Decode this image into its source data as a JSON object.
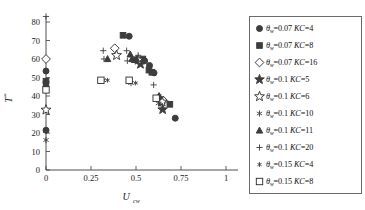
{
  "chart_data": {
    "type": "scatter",
    "title": "",
    "xlabel": "U_cw",
    "xlabel_main": "U",
    "xlabel_sub": "cw",
    "ylabel": "T*",
    "ylabel_main": "T",
    "ylabel_star": "*",
    "xlim": [
      0,
      1
    ],
    "ylim": [
      0,
      80
    ],
    "xticks": [
      0,
      0.25,
      0.5,
      0.75,
      1
    ],
    "xticklabels": [
      "0",
      "0.25",
      "0.5",
      "0.75",
      "1"
    ],
    "yticks": [
      0,
      10,
      20,
      30,
      40,
      50,
      60,
      70,
      80
    ],
    "yticklabels": [
      "0",
      "10",
      "20",
      "30",
      "40",
      "50",
      "60",
      "70",
      "80"
    ],
    "grid": false,
    "legend_position": "right-outside",
    "series": [
      {
        "name": "theta_w=0.07 KC=4",
        "label_theta": "θ",
        "label_sub": "w",
        "label_rest": "=0.07 ",
        "label_kc": "KC",
        "label_val": "=4",
        "marker": "filled-circle",
        "points": [
          {
            "x": 0.0,
            "y": 21.5
          },
          {
            "x": 0.0,
            "y": 47.5
          },
          {
            "x": 0.0,
            "y": 53.5
          },
          {
            "x": 0.462,
            "y": 72.3
          },
          {
            "x": 0.548,
            "y": 59.0
          },
          {
            "x": 0.575,
            "y": 56.5
          },
          {
            "x": 0.6,
            "y": 52.5
          },
          {
            "x": 0.718,
            "y": 28.0
          }
        ]
      },
      {
        "name": "theta_w=0.07 KC=8",
        "label_theta": "θ",
        "label_sub": "w",
        "label_rest": "=0.07 ",
        "label_kc": "KC",
        "label_val": "=8",
        "marker": "filled-square",
        "points": [
          {
            "x": 0.0,
            "y": 48.0
          },
          {
            "x": 0.428,
            "y": 72.8
          },
          {
            "x": 0.538,
            "y": 60.0
          },
          {
            "x": 0.572,
            "y": 54.0
          },
          {
            "x": 0.588,
            "y": 52.8
          },
          {
            "x": 0.688,
            "y": 35.5
          }
        ]
      },
      {
        "name": "theta_w=0.07 KC=16",
        "label_theta": "θ",
        "label_sub": "w",
        "label_rest": "=0.07 ",
        "label_kc": "KC",
        "label_val": "=16",
        "marker": "open-diamond",
        "points": [
          {
            "x": 0.0,
            "y": 60.0
          },
          {
            "x": 0.382,
            "y": 65.8
          },
          {
            "x": 0.652,
            "y": 37.5
          }
        ]
      },
      {
        "name": "theta_w=0.1 KC=5",
        "label_theta": "θ",
        "label_sub": "w",
        "label_rest": "=0.1 ",
        "label_kc": "KC",
        "label_val": "=5",
        "marker": "filled-star",
        "points": [
          {
            "x": 0.525,
            "y": 57.2
          },
          {
            "x": 0.648,
            "y": 32.7
          }
        ]
      },
      {
        "name": "theta_w=0.1 KC=6",
        "label_theta": "θ",
        "label_sub": "w",
        "label_rest": "=0.1 ",
        "label_kc": "KC",
        "label_val": "=6",
        "marker": "open-star",
        "points": [
          {
            "x": 0.0,
            "y": 32.5
          },
          {
            "x": 0.392,
            "y": 62.0
          },
          {
            "x": 0.512,
            "y": 59.5
          },
          {
            "x": 0.645,
            "y": 36.8
          }
        ]
      },
      {
        "name": "theta_w=0.1 KC=10",
        "label_theta": "θ",
        "label_sub": "w",
        "label_rest": "=0.1 ",
        "label_kc": "KC",
        "label_val": "=10",
        "marker": "asterisk",
        "points": [
          {
            "x": 0.0,
            "y": 16.2
          },
          {
            "x": 0.0,
            "y": 21.0
          },
          {
            "x": 0.0,
            "y": 47.0
          },
          {
            "x": 0.318,
            "y": 48.5
          },
          {
            "x": 0.472,
            "y": 47.0
          },
          {
            "x": 0.625,
            "y": 36.0
          }
        ]
      },
      {
        "name": "theta_w=0.1 KC=11",
        "label_theta": "θ",
        "label_sub": "w",
        "label_rest": "=0.1 ",
        "label_kc": "KC",
        "label_val": "=11",
        "marker": "filled-triangle",
        "points": [
          {
            "x": 0.0,
            "y": 46.5
          },
          {
            "x": 0.342,
            "y": 60.0
          },
          {
            "x": 0.468,
            "y": 62.5
          },
          {
            "x": 0.478,
            "y": 60.0
          },
          {
            "x": 0.492,
            "y": 59.5
          },
          {
            "x": 0.502,
            "y": 60.0
          },
          {
            "x": 0.628,
            "y": 40.0
          }
        ]
      },
      {
        "name": "theta_w=0.1 KC=20",
        "label_theta": "θ",
        "label_sub": "w",
        "label_rest": "=0.1 ",
        "label_kc": "KC",
        "label_val": "=20",
        "marker": "plus",
        "points": [
          {
            "x": 0.0,
            "y": 83.0
          },
          {
            "x": 0.318,
            "y": 64.5
          },
          {
            "x": 0.322,
            "y": 60.0
          },
          {
            "x": 0.448,
            "y": 64.5
          },
          {
            "x": 0.452,
            "y": 59.0
          },
          {
            "x": 0.512,
            "y": 62.0
          },
          {
            "x": 0.598,
            "y": 46.0
          },
          {
            "x": 0.638,
            "y": 39.5
          }
        ]
      },
      {
        "name": "theta_w=0.15 KC=4",
        "label_theta": "θ",
        "label_sub": "w",
        "label_rest": "=0.15 ",
        "label_kc": "KC",
        "label_val": "=4",
        "marker": "small-asterisk",
        "points": [
          {
            "x": 0.342,
            "y": 48.5
          },
          {
            "x": 0.498,
            "y": 47.0
          },
          {
            "x": 0.638,
            "y": 35.5
          }
        ]
      },
      {
        "name": "theta_w=0.15 KC=8",
        "label_theta": "θ",
        "label_sub": "w",
        "label_rest": "=0.15 ",
        "label_kc": "KC",
        "label_val": "=8",
        "marker": "open-square",
        "points": [
          {
            "x": 0.0,
            "y": 43.3
          },
          {
            "x": 0.305,
            "y": 48.5
          },
          {
            "x": 0.462,
            "y": 48.5
          },
          {
            "x": 0.612,
            "y": 38.8
          }
        ]
      }
    ]
  },
  "legend": {
    "items": [
      {
        "marker": "filled-circle",
        "theta": "θ",
        "sub": "w",
        "val": "=0.07 ",
        "kc": "KC",
        "kcval": "=4"
      },
      {
        "marker": "filled-square",
        "theta": "θ",
        "sub": "w",
        "val": "=0.07 ",
        "kc": "KC",
        "kcval": "=8"
      },
      {
        "marker": "open-diamond",
        "theta": "θ",
        "sub": "w",
        "val": "=0.07 ",
        "kc": "KC",
        "kcval": "=16"
      },
      {
        "marker": "filled-star",
        "theta": "θ",
        "sub": "w",
        "val": "=0.1 ",
        "kc": "KC",
        "kcval": "=5"
      },
      {
        "marker": "open-star",
        "theta": "θ",
        "sub": "w",
        "val": "=0.1 ",
        "kc": "KC",
        "kcval": "=6"
      },
      {
        "marker": "asterisk",
        "theta": "θ",
        "sub": "w",
        "val": "=0.1 ",
        "kc": "KC",
        "kcval": "=10"
      },
      {
        "marker": "filled-triangle",
        "theta": "θ",
        "sub": "w",
        "val": "=0.1 ",
        "kc": "KC",
        "kcval": "=11"
      },
      {
        "marker": "plus",
        "theta": "θ",
        "sub": "w",
        "val": "=0.1 ",
        "kc": "KC",
        "kcval": "=20"
      },
      {
        "marker": "small-asterisk",
        "theta": "θ",
        "sub": "w",
        "val": "=0.15 ",
        "kc": "KC",
        "kcval": "=4"
      },
      {
        "marker": "open-square",
        "theta": "θ",
        "sub": "w",
        "val": "=0.15 ",
        "kc": "KC",
        "kcval": "=8"
      }
    ]
  }
}
